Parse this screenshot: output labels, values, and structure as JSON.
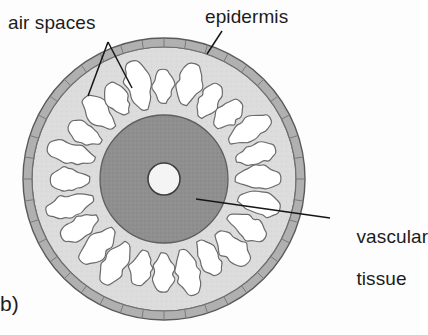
{
  "figure": {
    "panel_label": "b)",
    "title": "",
    "type": "biological-cross-section-diagram"
  },
  "labels": {
    "air_spaces": "air spaces",
    "epidermis": "epidermis",
    "vascular_line1": "vascular",
    "vascular_line2": "tissue"
  },
  "colors": {
    "epidermis_ring": "#b0b0b0",
    "cortex": "#dcdcdc",
    "air_space": "#ffffff",
    "vascular_tissue": "#8f8f8f",
    "central_cavity": "#f2f2f2",
    "outline": "#5a5a5a",
    "leader_line": "#161616",
    "text": "#1c1c1c",
    "background": "#fdfdfd"
  },
  "geometry": {
    "center_x": 164,
    "center_y": 179,
    "outer_radius": 141,
    "epidermis_inner_radius": 132,
    "cortex_inner_radius": 64,
    "stele_radius": 64,
    "central_cavity_radius": 16,
    "epidermis_cell_count": 40,
    "air_space_count": 24
  },
  "leaders": [
    {
      "name": "air-spaces-leader-a",
      "x1": 108,
      "y1": 42,
      "x2": 88,
      "y2": 96
    },
    {
      "name": "air-spaces-leader-b",
      "x1": 108,
      "y1": 42,
      "x2": 132,
      "y2": 88
    },
    {
      "name": "epidermis-leader",
      "x1": 222,
      "y1": 31,
      "x2": 207,
      "y2": 54
    },
    {
      "name": "vascular-leader",
      "x1": 196,
      "y1": 199,
      "x2": 330,
      "y2": 218
    }
  ]
}
